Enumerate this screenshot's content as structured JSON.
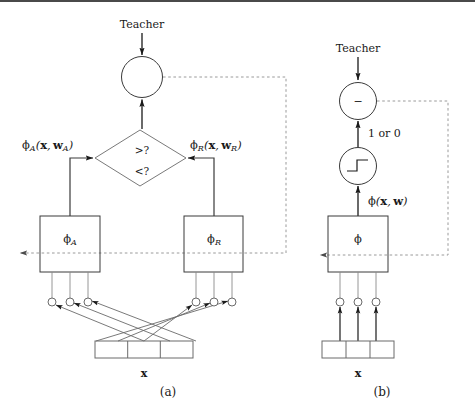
{
  "figure": {
    "panels": [
      {
        "id": "a",
        "caption": "(a)",
        "teacher_label": "Teacher",
        "comparator_lines": [
          ">?",
          "<?"
        ],
        "left_signal_label": "φA(x, wA)",
        "right_signal_label": "φR(x, wR)",
        "left_box_label": "φA",
        "right_box_label": "φR",
        "input_label": "x",
        "input_cells": 3,
        "left_units": 3,
        "right_units": 3,
        "summing_node_symbol": ""
      },
      {
        "id": "b",
        "caption": "(b)",
        "teacher_label": "Teacher",
        "error_node_symbol": "−",
        "output_label": "1 or 0",
        "activation_label": "φ(x, w)",
        "box_label": "φ",
        "input_label": "x",
        "input_cells": 3,
        "units": 3,
        "threshold_glyph": "step-function"
      }
    ],
    "colors": {
      "stroke": "#3a3a3a",
      "text": "#1a1a1a",
      "feedback_dashed": "#9a9a9a",
      "background": "#ffffff",
      "rule": "#4a4a4a"
    }
  }
}
